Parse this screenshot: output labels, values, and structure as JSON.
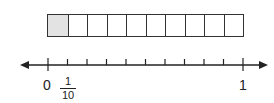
{
  "strip": {
    "cells": 10,
    "shaded": 1,
    "shade_color": "#e3e3e3"
  },
  "number_line": {
    "start_label": "0",
    "end_label": "1",
    "ticks": 11,
    "fraction": {
      "numerator": "1",
      "denominator": "10"
    }
  }
}
